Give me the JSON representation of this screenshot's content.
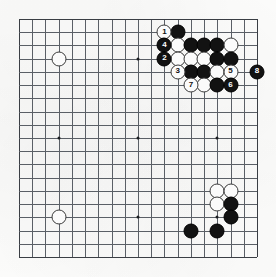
{
  "app": {
    "title": "Go board diagram",
    "board_size": 19,
    "description": "Go game problem diagram showing a joseki sequence in the upper right corner, numbered moves 1 through 8"
  },
  "board": {
    "size": 19,
    "origin_x": 19,
    "origin_y": 19,
    "spacing": 13.22,
    "line_color": "#5a5f66",
    "border_color": "#3a3e44",
    "background_color": "#fdfdfc",
    "black_color": "#121212",
    "white_color": "#fbfbfb",
    "star_points": [
      {
        "col": 3,
        "row": 3
      },
      {
        "col": 9,
        "row": 3
      },
      {
        "col": 15,
        "row": 3
      },
      {
        "col": 3,
        "row": 9
      },
      {
        "col": 9,
        "row": 9
      },
      {
        "col": 15,
        "row": 9
      },
      {
        "col": 3,
        "row": 15
      },
      {
        "col": 9,
        "row": 15
      },
      {
        "col": 15,
        "row": 15
      }
    ]
  },
  "stones": [
    {
      "col": 3,
      "row": 3,
      "color": "white",
      "label": ""
    },
    {
      "col": 3,
      "row": 15,
      "color": "white",
      "label": ""
    },
    {
      "col": 11,
      "row": 1,
      "color": "white",
      "label": "1"
    },
    {
      "col": 12,
      "row": 1,
      "color": "black",
      "label": ""
    },
    {
      "col": 11,
      "row": 2,
      "color": "black",
      "label": "4"
    },
    {
      "col": 12,
      "row": 2,
      "color": "white",
      "label": ""
    },
    {
      "col": 13,
      "row": 2,
      "color": "black",
      "label": ""
    },
    {
      "col": 14,
      "row": 2,
      "color": "black",
      "label": ""
    },
    {
      "col": 15,
      "row": 2,
      "color": "black",
      "label": ""
    },
    {
      "col": 16,
      "row": 2,
      "color": "white",
      "label": ""
    },
    {
      "col": 11,
      "row": 3,
      "color": "black",
      "label": "2"
    },
    {
      "col": 12,
      "row": 3,
      "color": "white",
      "label": ""
    },
    {
      "col": 13,
      "row": 3,
      "color": "white",
      "label": ""
    },
    {
      "col": 14,
      "row": 3,
      "color": "white",
      "label": ""
    },
    {
      "col": 15,
      "row": 3,
      "color": "black",
      "label": ""
    },
    {
      "col": 16,
      "row": 3,
      "color": "black",
      "label": ""
    },
    {
      "col": 12,
      "row": 4,
      "color": "white",
      "label": "3"
    },
    {
      "col": 13,
      "row": 4,
      "color": "black",
      "label": ""
    },
    {
      "col": 14,
      "row": 4,
      "color": "black",
      "label": ""
    },
    {
      "col": 15,
      "row": 4,
      "color": "white",
      "label": ""
    },
    {
      "col": 16,
      "row": 4,
      "color": "white",
      "label": "5"
    },
    {
      "col": 18,
      "row": 4,
      "color": "black",
      "label": "8"
    },
    {
      "col": 13,
      "row": 5,
      "color": "white",
      "label": "7"
    },
    {
      "col": 14,
      "row": 5,
      "color": "white",
      "label": ""
    },
    {
      "col": 15,
      "row": 5,
      "color": "black",
      "label": ""
    },
    {
      "col": 16,
      "row": 5,
      "color": "black",
      "label": "6"
    },
    {
      "col": 15,
      "row": 13,
      "color": "white",
      "label": ""
    },
    {
      "col": 16,
      "row": 13,
      "color": "white",
      "label": ""
    },
    {
      "col": 15,
      "row": 14,
      "color": "white",
      "label": ""
    },
    {
      "col": 16,
      "row": 14,
      "color": "black",
      "label": ""
    },
    {
      "col": 16,
      "row": 15,
      "color": "black",
      "label": ""
    },
    {
      "col": 15,
      "row": 16,
      "color": "black",
      "label": ""
    },
    {
      "col": 13,
      "row": 16,
      "color": "black",
      "label": ""
    }
  ],
  "move_sequence": [
    {
      "number": "1",
      "color": "white"
    },
    {
      "number": "2",
      "color": "black"
    },
    {
      "number": "3",
      "color": "white"
    },
    {
      "number": "4",
      "color": "black"
    },
    {
      "number": "5",
      "color": "white"
    },
    {
      "number": "6",
      "color": "black"
    },
    {
      "number": "7",
      "color": "white"
    },
    {
      "number": "8",
      "color": "black"
    }
  ]
}
